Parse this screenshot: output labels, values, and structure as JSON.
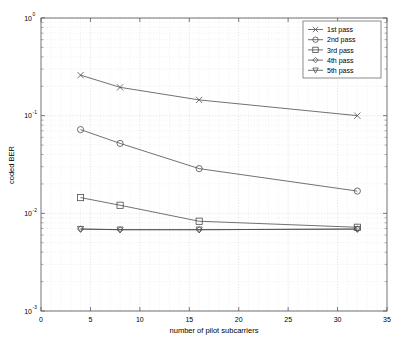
{
  "chart_data": {
    "type": "line",
    "title": "",
    "xlabel": "number of pilot subcarriers",
    "ylabel": "coded BER",
    "x": [
      4,
      8,
      16,
      32
    ],
    "xlim": [
      0,
      35
    ],
    "ylim": [
      0.001,
      1
    ],
    "yscale": "log",
    "grid": true,
    "legend_position": "top-right",
    "xticks": [
      "0",
      "5",
      "10",
      "15",
      "20",
      "25",
      "30",
      "35"
    ],
    "xtick_values": [
      0,
      5,
      10,
      15,
      20,
      25,
      30,
      35
    ],
    "yticks": [
      "10^0",
      "10^-1",
      "10^-2",
      "10^-3"
    ],
    "ytick_values": [
      1,
      0.1,
      0.01,
      0.001
    ],
    "series": [
      {
        "name": "1st pass",
        "marker": "x",
        "values": [
          0.26,
          0.195,
          0.145,
          0.1
        ]
      },
      {
        "name": "2nd pass",
        "marker": "circle",
        "values": [
          0.072,
          0.052,
          0.0287,
          0.0169
        ]
      },
      {
        "name": "3rd pass",
        "marker": "square",
        "values": [
          0.0145,
          0.0121,
          0.0083,
          0.0072
        ]
      },
      {
        "name": "4th pass",
        "marker": "diamond",
        "values": [
          0.0069,
          0.0068,
          0.0068,
          0.0069
        ]
      },
      {
        "name": "5th pass",
        "marker": "triangle-down",
        "values": [
          0.0069,
          0.0068,
          0.0068,
          0.0069
        ]
      }
    ]
  },
  "axes": {
    "ylabel": "coded BER",
    "xlabel": "number of pilot subcarriers",
    "x_ticks": [
      {
        "label": "0"
      },
      {
        "label": "5"
      },
      {
        "label": "10"
      },
      {
        "label": "15"
      },
      {
        "label": "20"
      },
      {
        "label": "25"
      },
      {
        "label": "30"
      },
      {
        "label": "35"
      }
    ],
    "y_ticks": [
      {
        "base": "10",
        "exp": "0"
      },
      {
        "base": "10",
        "exp": "-1"
      },
      {
        "base": "10",
        "exp": "-2"
      },
      {
        "base": "10",
        "exp": "-3"
      }
    ]
  },
  "legend": {
    "entries": [
      {
        "label": "1st pass"
      },
      {
        "label": "2nd pass"
      },
      {
        "label": "3rd pass"
      },
      {
        "label": "4th pass"
      },
      {
        "label": "5th pass"
      }
    ]
  },
  "colors": {
    "line": "#4d4d4d",
    "frame": "#5b5b5b",
    "grid_major": "#c9c9c9",
    "grid_minor": "#dedede",
    "background": "#ffffff"
  }
}
